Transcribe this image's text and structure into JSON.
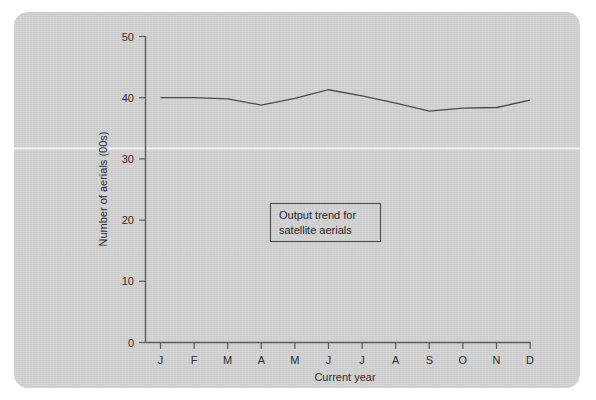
{
  "figure": {
    "background_color": "#d3d3d3",
    "page_color": "#ffffff",
    "line_color": "#4a4a4a",
    "axis_color": "#5b5b5b",
    "text_color": "#2e2e2e"
  },
  "annotation": {
    "line1": "Output trend for",
    "line2": "satellite aerials"
  },
  "chart_data": {
    "type": "line",
    "title": "",
    "xlabel": "Current year",
    "ylabel": "Number of aerials (00s)",
    "categories": [
      "J",
      "F",
      "M",
      "A",
      "M",
      "J",
      "J",
      "A",
      "S",
      "O",
      "N",
      "D"
    ],
    "category_names": [
      "January",
      "February",
      "March",
      "April",
      "May",
      "June",
      "July",
      "August",
      "September",
      "October",
      "November",
      "December"
    ],
    "values": [
      40.0,
      40.0,
      39.8,
      38.8,
      39.9,
      41.3,
      40.3,
      39.1,
      37.8,
      38.3,
      38.4,
      39.6
    ],
    "series": [
      {
        "name": "Satellite aerials output",
        "values": [
          40.0,
          40.0,
          39.8,
          38.8,
          39.9,
          41.3,
          40.3,
          39.1,
          37.8,
          38.3,
          38.4,
          39.6
        ]
      }
    ],
    "ylim": [
      0,
      50
    ],
    "yticks": [
      0,
      10,
      20,
      30,
      40,
      50
    ],
    "ytick_labels": [
      "0",
      "10",
      "20",
      "30",
      "40",
      "50"
    ],
    "xlim": [
      0,
      11
    ],
    "grid": false,
    "legend": false,
    "annotations": [
      "Output trend for satellite aerials"
    ]
  }
}
